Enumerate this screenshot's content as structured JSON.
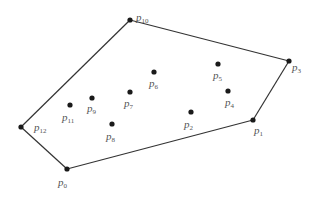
{
  "diagram": {
    "title": "",
    "hull_order": [
      "p0",
      "p1",
      "p3",
      "p10",
      "p12"
    ],
    "points": [
      {
        "id": "p0",
        "name": "p",
        "sub": "0",
        "on_hull": true
      },
      {
        "id": "p1",
        "name": "p",
        "sub": "1",
        "on_hull": true
      },
      {
        "id": "p2",
        "name": "p",
        "sub": "2",
        "on_hull": false
      },
      {
        "id": "p3",
        "name": "p",
        "sub": "3",
        "on_hull": true
      },
      {
        "id": "p4",
        "name": "p",
        "sub": "4",
        "on_hull": false
      },
      {
        "id": "p5",
        "name": "p",
        "sub": "5",
        "on_hull": false
      },
      {
        "id": "p6",
        "name": "p",
        "sub": "6",
        "on_hull": false
      },
      {
        "id": "p7",
        "name": "p",
        "sub": "7",
        "on_hull": false
      },
      {
        "id": "p8",
        "name": "p",
        "sub": "8",
        "on_hull": false
      },
      {
        "id": "p9",
        "name": "p",
        "sub": "9",
        "on_hull": false
      },
      {
        "id": "p10",
        "name": "p",
        "sub": "10",
        "on_hull": true
      },
      {
        "id": "p11",
        "name": "p",
        "sub": "11",
        "on_hull": false
      },
      {
        "id": "p12",
        "name": "p",
        "sub": "12",
        "on_hull": true
      }
    ],
    "colors": {
      "point": "#1a1a1a",
      "edge": "#333333",
      "label": "#555555"
    }
  }
}
